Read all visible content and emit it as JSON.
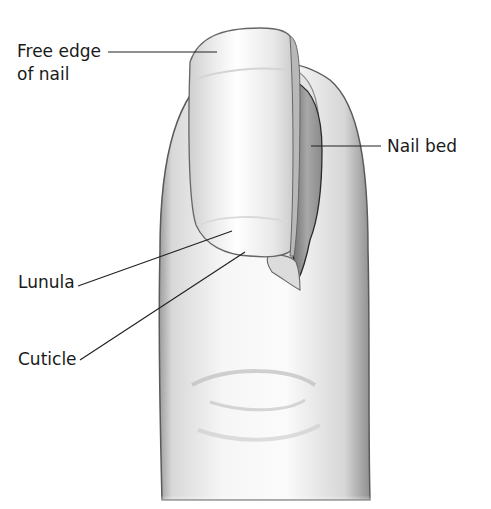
{
  "diagram": {
    "labels": {
      "free_edge_line1": "Free edge",
      "free_edge_line2": "of nail",
      "nail_bed": "Nail bed",
      "lunula": "Lunula",
      "cuticle": "Cuticle"
    },
    "colors": {
      "background": "#ffffff",
      "outline": "#555555",
      "skin_light": "#f4f4f4",
      "skin_shade": "#c8c8c8",
      "nail_bed": "#9a9a9a",
      "text": "#1a1a1a"
    }
  }
}
